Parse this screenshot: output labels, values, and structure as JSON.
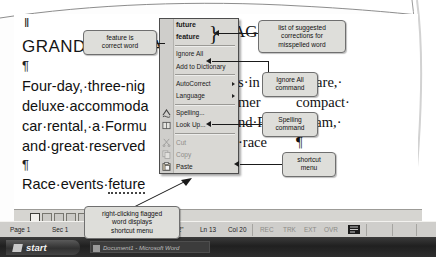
{
  "figure": {
    "caption_note": "Microsoft Word spelling shortcut menu annotated figure"
  },
  "document": {
    "title": "GRAND PRIX RACING PACKAGE",
    "title_visible": "GRAND PRIX RACING",
    "paragraph_mark": "¶",
    "lines": [
      "Four-day, three-night package includes airfare,",
      "deluxe accommodations at local amenities, compact",
      "car rental, a Formula One Driving Program,",
      "and great reserved seating at all race events."
    ],
    "lines_visible": [
      "Four-day,·three-nig",
      "deluxe·accommoda",
      "car·rental,·a·Formu",
      "and·great·reserved"
    ],
    "lines_right": [
      "s·in",
      "mer",
      "nd·F",
      "·race"
    ],
    "lines_far_right": [
      "airfare,·",
      "compact·",
      "ogram,·",
      "¶"
    ],
    "flagged_line_prefix": "Race·events·",
    "flagged_word": "feture"
  },
  "shortcut_menu": {
    "name": "shortcut-menu",
    "suggestions": [
      {
        "label": "future",
        "icon": "none"
      },
      {
        "label": "feature",
        "icon": "none"
      }
    ],
    "commands": [
      {
        "label": "Ignore All",
        "icon": "none",
        "submenu": false,
        "disabled": false
      },
      {
        "label": "Add to Dictionary",
        "icon": "none",
        "submenu": false,
        "disabled": false
      },
      {
        "label": "AutoCorrect",
        "icon": "none",
        "submenu": true,
        "disabled": false
      },
      {
        "label": "Language",
        "icon": "none",
        "submenu": true,
        "disabled": false
      },
      {
        "label": "Spelling...",
        "icon": "spelling-icon",
        "submenu": false,
        "disabled": false
      },
      {
        "label": "Look Up...",
        "icon": "lookup-icon",
        "submenu": false,
        "disabled": false
      },
      {
        "label": "Cut",
        "icon": "cut-icon",
        "submenu": false,
        "disabled": true
      },
      {
        "label": "Copy",
        "icon": "copy-icon",
        "submenu": false,
        "disabled": true
      },
      {
        "label": "Paste",
        "icon": "paste-icon",
        "submenu": false,
        "disabled": false
      }
    ]
  },
  "callouts": {
    "feature_correct": "feature is\ncorrect word",
    "suggestion_list": "list of suggested\ncorrections for\nmisspelled word",
    "ignore_all": "Ignore All\ncommand",
    "spelling": "Spelling\ncommand",
    "shortcut_menu": "shortcut\nmenu",
    "right_click": "right-clicking flagged\nword displays\nshortcut menu"
  },
  "view_bar": {
    "buttons": [
      "normal-view",
      "web-layout-view",
      "print-layout-view",
      "outline-view",
      "reading-view"
    ]
  },
  "status_bar": {
    "page": "Page 1",
    "section": "Sec 1",
    "pages": "1/1",
    "at": "At 2\"",
    "line": "Ln 13",
    "column": "Col 20",
    "rec": "REC",
    "trk": "TRK",
    "ext": "EXT",
    "ovr": "OVR",
    "spell_icon": "spelling-status-icon"
  },
  "taskbar": {
    "start_label": "start",
    "window_title": "Document1 - Microsoft Word"
  },
  "colors": {
    "menu_bg": "#d9d8d4",
    "menu_border": "#4d4d4d",
    "callout_bg": "#dededa",
    "callout_border": "#6f6f6f",
    "statusbar_bg": "#cfcecb",
    "taskbar_bg": "#2a2a2a"
  }
}
